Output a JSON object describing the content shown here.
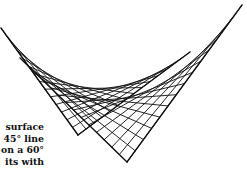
{
  "figure": {
    "stroke_color": "#111111",
    "background": "#ffffff",
    "frames": [
      {
        "name": "45-degree-frame",
        "start": [
          1,
          28
        ],
        "apex": [
          78,
          135
        ],
        "end": [
          190,
          52
        ],
        "chords": 14
      },
      {
        "name": "60-degree-frame",
        "start": [
          20,
          58
        ],
        "apex": [
          127,
          162
        ],
        "end": [
          242,
          5
        ],
        "chords": 14
      }
    ]
  },
  "caption": {
    "lines": [
      "surface",
      "45° line",
      "on a 60°",
      "its with"
    ]
  }
}
